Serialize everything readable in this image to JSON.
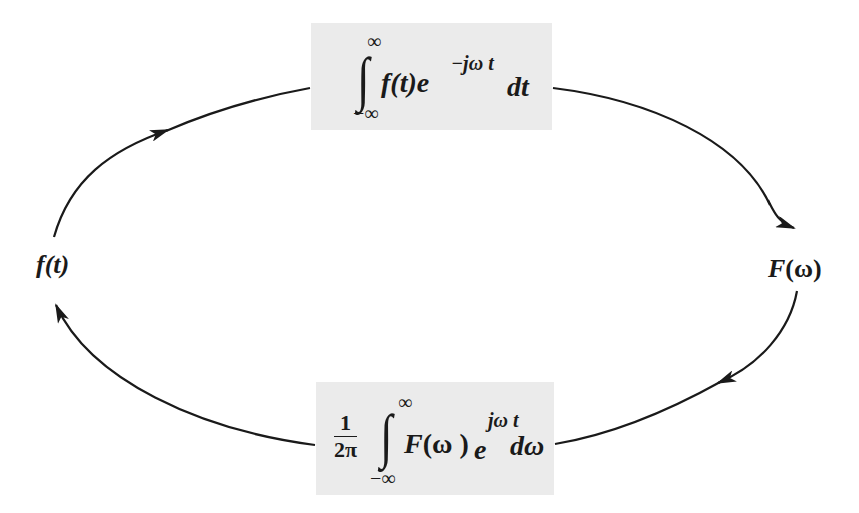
{
  "diagram": {
    "nodes": {
      "left": {
        "label_fn": "f",
        "label_arg": "(t)",
        "full": "f(t)"
      },
      "right": {
        "label_fn": "F",
        "label_arg": "(ω)",
        "full": "F(ω)"
      }
    },
    "boxes": {
      "top": {
        "role": "forward-transform",
        "upper_limit": "∞",
        "lower_limit": "−∞",
        "integral": "∫",
        "integrand_fn": "f",
        "integrand_arg": "(t)",
        "exp_base": "e",
        "exponent": "−jω t",
        "differential": "dt",
        "full": "∫_{−∞}^{∞} f(t) e^{−jωt} dt"
      },
      "bottom": {
        "role": "inverse-transform",
        "coef_num": "1",
        "coef_den": "2π",
        "upper_limit": "∞",
        "lower_limit": "−∞",
        "integral": "∫",
        "integrand_fn": "F",
        "integrand_arg": "(ω )",
        "exp_base": "e",
        "exponent": "jω t",
        "differential": "dω",
        "full": "(1/2π) ∫_{−∞}^{∞} F(ω) e^{jωt} dω"
      }
    },
    "arrows": [
      {
        "from": "f(t)",
        "to": "top-box",
        "direction": "clockwise"
      },
      {
        "from": "top-box",
        "to": "F(ω)",
        "direction": "clockwise"
      },
      {
        "from": "F(ω)",
        "to": "bottom-box",
        "direction": "clockwise"
      },
      {
        "from": "bottom-box",
        "to": "f(t)",
        "direction": "clockwise"
      }
    ],
    "colors": {
      "box_fill": "#ebebeb",
      "stroke": "#1a1a1a",
      "background": "#ffffff"
    }
  }
}
